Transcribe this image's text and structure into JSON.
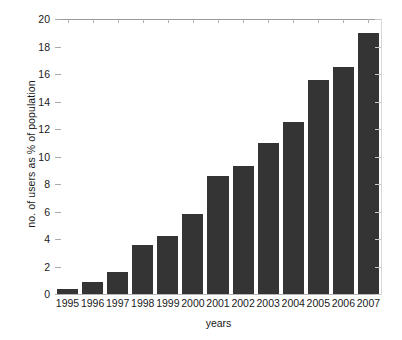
{
  "chart_data": {
    "type": "bar",
    "title": "",
    "xlabel": "years",
    "ylabel": "no. of users as % of population",
    "categories": [
      "1995",
      "1996",
      "1997",
      "1998",
      "1999",
      "2000",
      "2001",
      "2002",
      "2003",
      "2004",
      "2005",
      "2006",
      "2007"
    ],
    "values": [
      0.4,
      0.9,
      1.6,
      3.6,
      4.2,
      5.8,
      8.6,
      9.3,
      11.0,
      12.5,
      15.6,
      16.5,
      19.0
    ],
    "ylim": [
      0,
      20
    ],
    "y_ticks": [
      0,
      2,
      4,
      6,
      8,
      10,
      12,
      14,
      16,
      18,
      20
    ],
    "y_tick_labels": [
      "0",
      "2",
      "4",
      "6",
      "8",
      "10",
      "12",
      "14",
      "16",
      "18",
      "20"
    ],
    "grid": false,
    "legend": null,
    "bar_color": "#343434",
    "axis_color": "#9a9a9a",
    "text_color": "#1a1a1a",
    "background": "#ffffff"
  }
}
